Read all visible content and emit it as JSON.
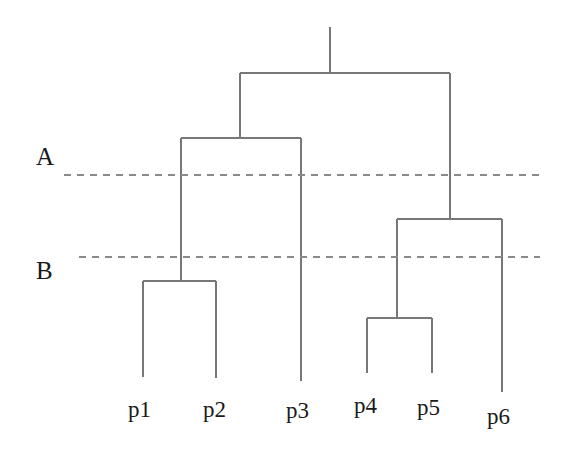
{
  "figure": {
    "kind": "dendrogram",
    "width": 562,
    "height": 457,
    "background_color": "#ffffff",
    "line_color": "#777777",
    "line_width": 1.2,
    "text_color": "#1a1a1a",
    "dash_color": "#8a8a8a"
  },
  "chart_data": {
    "type": "tree",
    "title": "",
    "xlabel": "",
    "ylabel": "",
    "legend": [],
    "grid": false,
    "orientation": "top-down",
    "leaves": [
      {
        "id": "p1",
        "label": "p1",
        "x": 143,
        "leaf_y": 377,
        "label_x": 128,
        "label_y": 398
      },
      {
        "id": "p2",
        "label": "p2",
        "x": 216,
        "leaf_y": 378,
        "label_x": 203,
        "label_y": 398
      },
      {
        "id": "p3",
        "label": "p3",
        "x": 301,
        "leaf_y": 381,
        "label_x": 286,
        "label_y": 399
      },
      {
        "id": "p4",
        "label": "p4",
        "x": 367,
        "leaf_y": 373,
        "label_x": 354,
        "label_y": 394
      },
      {
        "id": "p5",
        "label": "p5",
        "x": 432,
        "leaf_y": 373,
        "label_x": 417,
        "label_y": 396
      },
      {
        "id": "p6",
        "label": "p6",
        "x": 502,
        "leaf_y": 392,
        "label_x": 487,
        "label_y": 405
      }
    ],
    "merges": [
      {
        "id": "n1",
        "name": "p1-p2-merge",
        "children": [
          "p1",
          "p2"
        ],
        "height_y": 281,
        "center_x": 181,
        "left_x": 143,
        "right_x": 216
      },
      {
        "id": "n2",
        "name": "p4-p5-merge",
        "children": [
          "p4",
          "p5"
        ],
        "height_y": 318,
        "center_x": 397,
        "left_x": 367,
        "right_x": 432
      },
      {
        "id": "n3",
        "name": "n1-p3-merge",
        "children": [
          "n1",
          "p3"
        ],
        "height_y": 138,
        "center_x": 240,
        "left_x": 181,
        "right_x": 301
      },
      {
        "id": "n4",
        "name": "n2-p6-merge",
        "children": [
          "n2",
          "p6"
        ],
        "height_y": 219,
        "center_x": 450,
        "left_x": 397,
        "right_x": 502
      },
      {
        "id": "n5",
        "name": "root-merge",
        "children": [
          "n3",
          "n4"
        ],
        "height_y": 73,
        "center_x": 330,
        "left_x": 240,
        "right_x": 450
      }
    ],
    "root_stem": {
      "x": 330,
      "y_top": 27,
      "y_bottom": 73
    },
    "cut_lines": [
      {
        "id": "A",
        "label": "A",
        "y": 175,
        "x_start": 64,
        "x_end": 540,
        "label_x": 36,
        "label_y": 144,
        "style": "dashed"
      },
      {
        "id": "B",
        "label": "B",
        "y": 257,
        "x_start": 79,
        "x_end": 540,
        "label_x": 36,
        "label_y": 258,
        "style": "dashed"
      }
    ]
  }
}
